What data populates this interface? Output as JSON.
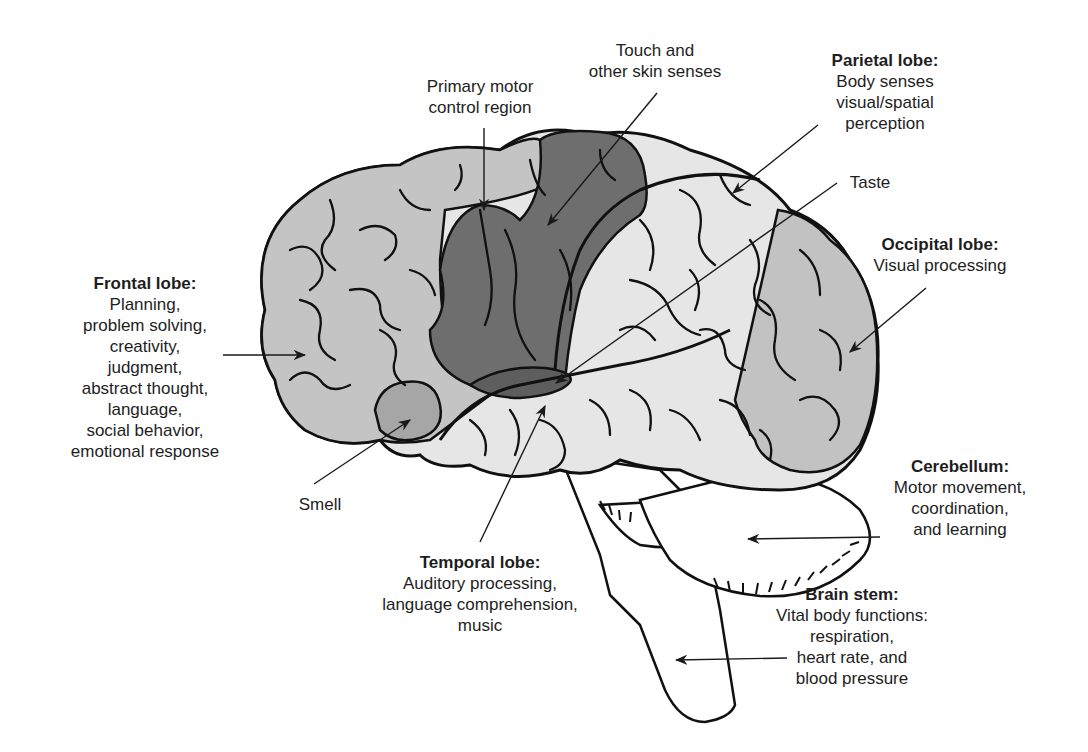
{
  "diagram": {
    "colors": {
      "frontal": "#c4c4c4",
      "motor_sensory": "#707070",
      "smell": "#a6a6a6",
      "taste": "#5e5e5e",
      "parietal_temporal": "#e6e6e6",
      "occipital": "#c2c2c2",
      "outline": "#111111",
      "cerebellum_stem": "#ffffff"
    }
  },
  "labels": {
    "frontal": {
      "title": "Frontal lobe:",
      "lines": [
        "Planning,",
        "problem solving,",
        "creativity,",
        "judgment,",
        "abstract thought,",
        "language,",
        "social behavior,",
        "emotional response"
      ]
    },
    "motor": {
      "lines": [
        "Primary motor",
        "control region"
      ]
    },
    "touch": {
      "lines": [
        "Touch and",
        "other skin senses"
      ]
    },
    "parietal": {
      "title": "Parietal lobe:",
      "lines": [
        "Body senses",
        "visual/spatial",
        "perception"
      ]
    },
    "taste": {
      "lines": [
        "Taste"
      ]
    },
    "occipital": {
      "title": "Occipital lobe:",
      "lines": [
        "Visual processing"
      ]
    },
    "smell": {
      "lines": [
        "Smell"
      ]
    },
    "temporal": {
      "title": "Temporal lobe:",
      "lines": [
        "Auditory processing,",
        "language comprehension,",
        "music"
      ]
    },
    "cerebellum": {
      "title": "Cerebellum:",
      "lines": [
        "Motor movement,",
        "coordination,",
        "and learning"
      ]
    },
    "brainstem": {
      "title": "Brain stem:",
      "lines": [
        "Vital body functions:",
        "respiration,",
        "heart rate, and",
        "blood pressure"
      ]
    }
  }
}
